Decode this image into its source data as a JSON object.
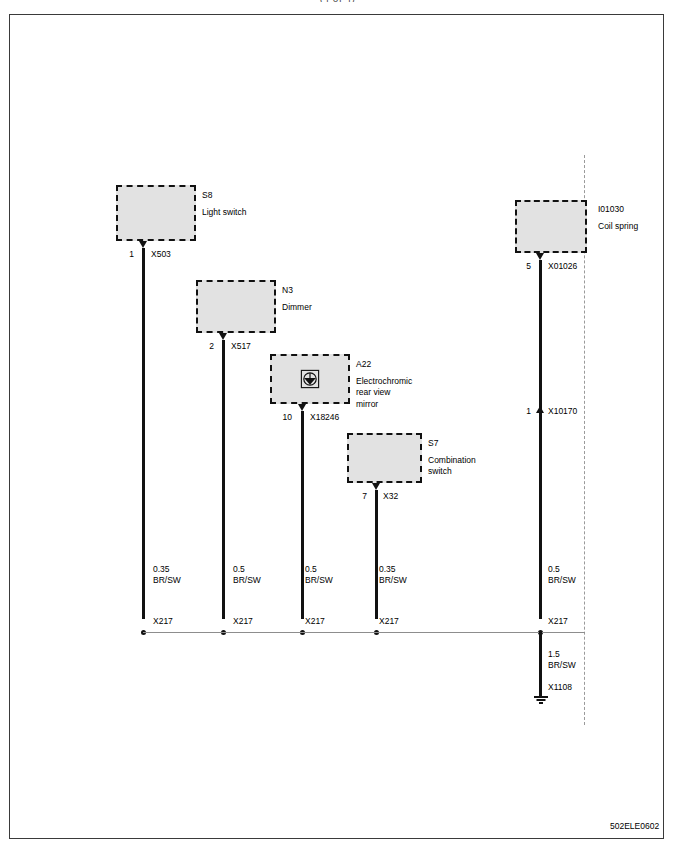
{
  "top_caption": "(4 of 4)",
  "drawing_id": "502ELE0602",
  "blocks": [
    {
      "code": "S8",
      "desc_lines": [
        "Light switch"
      ]
    },
    {
      "code": "N3",
      "desc_lines": [
        "Dimmer"
      ]
    },
    {
      "code": "A22",
      "desc_lines": [
        "Electrochromic",
        "rear view",
        "mirror"
      ],
      "icon": "rear-view-mirror-icon"
    },
    {
      "code": "S7",
      "desc_lines": [
        "Combination",
        "switch"
      ]
    },
    {
      "code": "I01030",
      "desc_lines": [
        "Coil spring"
      ]
    }
  ],
  "connectors": [
    {
      "pin": "1",
      "id": "X503"
    },
    {
      "pin": "2",
      "id": "X517"
    },
    {
      "pin": "10",
      "id": "X18246"
    },
    {
      "pin": "7",
      "id": "X32"
    },
    {
      "pin": "5",
      "id": "X01026"
    },
    {
      "pin": "1",
      "id": "X10170"
    }
  ],
  "wire_specs": [
    {
      "gauge": "0.35",
      "color": "BR/SW"
    },
    {
      "gauge": "0.5",
      "color": "BR/SW"
    },
    {
      "gauge": "0.5",
      "color": "BR/SW"
    },
    {
      "gauge": "0.35",
      "color": "BR/SW"
    },
    {
      "gauge": "0.5",
      "color": "BR/SW"
    },
    {
      "gauge": "1.5",
      "color": "BR/SW"
    }
  ],
  "splices": [
    {
      "label": "X217"
    },
    {
      "label": "X217"
    },
    {
      "label": "X217"
    },
    {
      "label": "X217"
    },
    {
      "label": "X217"
    }
  ],
  "ground": {
    "label": "X1108"
  },
  "colors": {
    "wire": "#111111",
    "block_fill": "#e2e2e2",
    "block_border": "#111111",
    "bus": "#8d8d8d",
    "boundary": "#9a9a9a",
    "frame": "#3a3a3a"
  }
}
